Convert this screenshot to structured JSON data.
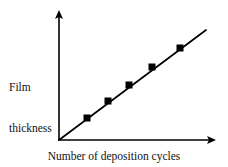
{
  "figure": {
    "background_color": "#ffffff",
    "ink_color": "#000000"
  },
  "axes": {
    "y_label_line1": "Film",
    "y_label_line2": "thickness",
    "x_label": "Number of deposition cycles",
    "y_arrow": "arrow-up-icon",
    "x_arrow": "arrow-right-icon"
  },
  "chart_data": {
    "type": "scatter",
    "title": "",
    "xlabel": "Number of deposition cycles",
    "ylabel": "Film thickness",
    "grid": false,
    "legend": false,
    "axis_arrows": true,
    "tick_labels_x": [],
    "tick_labels_y": [],
    "xlim": [
      0,
      10
    ],
    "ylim": [
      0,
      10
    ],
    "series": [
      {
        "name": "Film thickness vs deposition cycles",
        "marker": "filled-square",
        "marker_color": "#000000",
        "line_color": "#000000",
        "line_style": "solid",
        "x": [
          2,
          3.4,
          4.8,
          6.3,
          8.2
        ],
        "y": [
          1.5,
          2.6,
          3.7,
          4.9,
          6.3
        ],
        "x_px": [
          87,
          108,
          129,
          152,
          180
        ],
        "y_px": [
          118,
          101,
          85,
          67,
          48
        ]
      }
    ],
    "trendline": {
      "description": "straight line through origin",
      "start_px": [
        59,
        140
      ],
      "end_px": [
        206,
        30
      ],
      "start": [
        0,
        0
      ],
      "end": [
        10.5,
        8.3
      ]
    },
    "annotation": "Linear increase of film thickness with number of deposition cycles"
  }
}
